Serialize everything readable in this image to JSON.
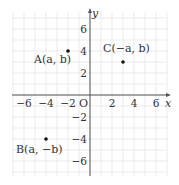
{
  "diagram": {
    "type": "coordinate-plane",
    "x_axis_label": "x",
    "y_axis_label": "y",
    "origin_label": "O",
    "range": {
      "xmin": -7,
      "xmax": 7,
      "ymin": -7,
      "ymax": 7
    },
    "x_ticks": [
      {
        "value": -6,
        "label": "−6"
      },
      {
        "value": -4,
        "label": "−4"
      },
      {
        "value": -2,
        "label": "−2"
      },
      {
        "value": 2,
        "label": "2"
      },
      {
        "value": 4,
        "label": "4"
      },
      {
        "value": 6,
        "label": "6"
      }
    ],
    "y_ticks": [
      {
        "value": 6,
        "label": "6"
      },
      {
        "value": 4,
        "label": "4"
      },
      {
        "value": 2,
        "label": "2"
      },
      {
        "value": -2,
        "label": "−2"
      },
      {
        "value": -4,
        "label": "−4"
      },
      {
        "value": -6,
        "label": "−6"
      }
    ],
    "points": [
      {
        "name": "A",
        "label": "A(a, b)",
        "x": -2,
        "y": 4
      },
      {
        "name": "B",
        "label": "B(a, −b)",
        "x": -4,
        "y": -4
      },
      {
        "name": "C",
        "label": "C(−a, b)",
        "x": 3,
        "y": 3
      }
    ],
    "colors": {
      "grid": "#e6e6e6",
      "axis": "#555555",
      "point": "#111111",
      "text": "#333333"
    }
  }
}
